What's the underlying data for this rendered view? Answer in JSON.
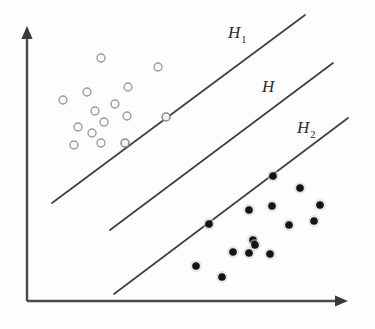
{
  "figure": {
    "background_color": "#fdfdfd"
  },
  "axes": {
    "origin": [
      27,
      301
    ],
    "y_axis_top": [
      27,
      26
    ],
    "x_axis_right": [
      348,
      301
    ],
    "color": "#4a4a4a",
    "y_label": "",
    "x_label": "",
    "ticks": "none"
  },
  "labels": {
    "h1": {
      "base": "H",
      "sub": "1",
      "x": 228,
      "y": 38
    },
    "h": {
      "base": "H",
      "sub": "",
      "x": 262,
      "y": 92
    },
    "h2": {
      "base": "H",
      "sub": "2",
      "x": 297,
      "y": 133
    }
  },
  "chart_data": {
    "type": "scatter",
    "xlabel": "",
    "ylabel": "",
    "xlim": [
      27,
      348
    ],
    "ylim": [
      301,
      26
    ],
    "grid": false,
    "legend": "none",
    "colors": {
      "open_circle_stroke": "#9a9a9a",
      "filled_dot": "#141414",
      "hyperplane": "#3f3f46",
      "axis": "#4a4a4a"
    },
    "annotations": [
      {
        "text": "H1",
        "display": "H₁",
        "x": 228,
        "y": 38,
        "target_line": "H1"
      },
      {
        "text": "H",
        "display": "H",
        "x": 262,
        "y": 92,
        "target_line": "H"
      },
      {
        "text": "H2",
        "display": "H₂",
        "x": 297,
        "y": 133,
        "target_line": "H2"
      }
    ],
    "lines": [
      {
        "name": "H1",
        "label": "H₁",
        "role": "margin-boundary-class1",
        "x1": 52,
        "y1": 203,
        "x2": 305,
        "y2": 15,
        "slope": -0.743
      },
      {
        "name": "H",
        "label": "H",
        "role": "separating-hyperplane",
        "x1": 110,
        "y1": 230,
        "x2": 333,
        "y2": 63,
        "slope": -0.749
      },
      {
        "name": "H2",
        "label": "H₂",
        "role": "margin-boundary-class2",
        "x1": 114,
        "y1": 294,
        "x2": 348,
        "y2": 118,
        "slope": -0.752
      }
    ],
    "series": [
      {
        "name": "class-1-open-circles",
        "marker": "open-circle",
        "radius": 4.0,
        "count": 14,
        "points": [
          {
            "x": 101,
            "y": 58,
            "support_vector": false
          },
          {
            "x": 158,
            "y": 67,
            "support_vector": false
          },
          {
            "x": 128,
            "y": 87,
            "support_vector": false
          },
          {
            "x": 87,
            "y": 92,
            "support_vector": false
          },
          {
            "x": 63,
            "y": 100,
            "support_vector": false
          },
          {
            "x": 115,
            "y": 104,
            "support_vector": false
          },
          {
            "x": 95,
            "y": 111,
            "support_vector": false
          },
          {
            "x": 127,
            "y": 116,
            "support_vector": false
          },
          {
            "x": 166,
            "y": 117,
            "support_vector": true
          },
          {
            "x": 104,
            "y": 122,
            "support_vector": false
          },
          {
            "x": 78,
            "y": 127,
            "support_vector": false
          },
          {
            "x": 92,
            "y": 133,
            "support_vector": false
          },
          {
            "x": 125,
            "y": 143,
            "support_vector": true
          },
          {
            "x": 74,
            "y": 145,
            "support_vector": false
          },
          {
            "x": 101,
            "y": 143,
            "support_vector": false
          }
        ]
      },
      {
        "name": "class-2-filled-dots",
        "marker": "filled-dot",
        "radius": 3.6,
        "count": 15,
        "points": [
          {
            "x": 273,
            "y": 176,
            "support_vector": true
          },
          {
            "x": 300,
            "y": 188,
            "support_vector": false
          },
          {
            "x": 272,
            "y": 206,
            "support_vector": false
          },
          {
            "x": 249,
            "y": 210,
            "support_vector": false
          },
          {
            "x": 320,
            "y": 205,
            "support_vector": false
          },
          {
            "x": 209,
            "y": 224,
            "support_vector": true
          },
          {
            "x": 289,
            "y": 225,
            "support_vector": false
          },
          {
            "x": 314,
            "y": 221,
            "support_vector": false
          },
          {
            "x": 253,
            "y": 240,
            "support_vector": false
          },
          {
            "x": 233,
            "y": 252,
            "support_vector": false
          },
          {
            "x": 249,
            "y": 253,
            "support_vector": false
          },
          {
            "x": 270,
            "y": 254,
            "support_vector": false
          },
          {
            "x": 196,
            "y": 266,
            "support_vector": false
          },
          {
            "x": 222,
            "y": 277,
            "support_vector": false
          },
          {
            "x": 255,
            "y": 245,
            "support_vector": false
          }
        ]
      }
    ]
  }
}
